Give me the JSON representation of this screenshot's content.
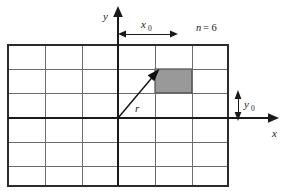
{
  "figure": {
    "background_color": "#ffffff",
    "grid": {
      "columns": 6,
      "rows": 6,
      "left": 8,
      "top": 45,
      "right": 228,
      "bottom": 186,
      "cell_width": 36.667,
      "cell_height": 23.5,
      "border_color": "#2b2b2b",
      "border_width": 2,
      "inner_line_color": "#6d6d6d",
      "inner_line_width": 1
    },
    "shaded_cell": {
      "column_index": 4,
      "row_index": 1,
      "x": 155,
      "y": 69,
      "width": 37,
      "height": 24,
      "fill_color": "#999999",
      "stroke_color": "#2b2b2b"
    },
    "axes": {
      "color": "#1a1a1a",
      "origin_x": 118,
      "origin_y": 118,
      "y_axis": {
        "label": "y",
        "top": 10,
        "bottom": 186
      },
      "x_axis": {
        "label": "x",
        "left": 8,
        "right": 277
      }
    },
    "vector": {
      "label": "r",
      "from_x": 118,
      "from_y": 118,
      "to_x": 158,
      "to_y": 71,
      "color": "#111111",
      "width": 1.4
    },
    "dimensions": [
      {
        "name": "x0-dimension",
        "label_base": "x",
        "label_sub": "0",
        "orientation": "horizontal",
        "from_x": 118,
        "to_x": 178,
        "y": 34
      },
      {
        "name": "y0-dimension",
        "label_base": "y",
        "label_sub": "0",
        "orientation": "vertical",
        "from_y": 93,
        "to_y": 118,
        "x": 238
      }
    ],
    "annotations": [
      {
        "name": "n-equals-label",
        "text_italic": "n",
        "text_rest": " = 6",
        "x": 196,
        "y": 34
      }
    ]
  }
}
